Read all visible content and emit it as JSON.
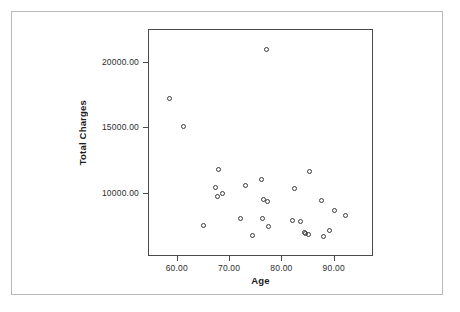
{
  "chart_data": {
    "type": "scatter",
    "title": "",
    "xlabel": "Age",
    "ylabel": "Total Charges",
    "xlim": [
      54.5,
      97.5
    ],
    "ylim": [
      5200,
      22500
    ],
    "grid": false,
    "legend": null,
    "marker": "open-circle",
    "xticks": [
      60,
      70,
      80,
      90
    ],
    "xtick_labels": [
      "60.00",
      "70.00",
      "80.00",
      "90.00"
    ],
    "yticks": [
      10000,
      15000,
      20000
    ],
    "ytick_labels": [
      "10000.00",
      "15000.00",
      "20000.00"
    ],
    "series": [
      {
        "name": "Total Charges vs Age",
        "points": [
          {
            "x": 58.5,
            "y": 17250
          },
          {
            "x": 61.0,
            "y": 15150
          },
          {
            "x": 65.0,
            "y": 7600
          },
          {
            "x": 67.8,
            "y": 11900
          },
          {
            "x": 67.2,
            "y": 10500
          },
          {
            "x": 67.5,
            "y": 9800
          },
          {
            "x": 68.5,
            "y": 10050
          },
          {
            "x": 72.0,
            "y": 8150
          },
          {
            "x": 73.0,
            "y": 10650
          },
          {
            "x": 74.3,
            "y": 6850
          },
          {
            "x": 76.0,
            "y": 11100
          },
          {
            "x": 76.1,
            "y": 8150
          },
          {
            "x": 76.3,
            "y": 9550
          },
          {
            "x": 77.1,
            "y": 9400
          },
          {
            "x": 77.3,
            "y": 7500
          },
          {
            "x": 77.0,
            "y": 21000
          },
          {
            "x": 82.0,
            "y": 7950
          },
          {
            "x": 82.3,
            "y": 10450
          },
          {
            "x": 83.4,
            "y": 7900
          },
          {
            "x": 84.2,
            "y": 7050
          },
          {
            "x": 84.5,
            "y": 7000
          },
          {
            "x": 85.0,
            "y": 6950
          },
          {
            "x": 85.1,
            "y": 11700
          },
          {
            "x": 87.5,
            "y": 9500
          },
          {
            "x": 87.8,
            "y": 6800
          },
          {
            "x": 89.0,
            "y": 7250
          },
          {
            "x": 90.0,
            "y": 8750
          },
          {
            "x": 92.0,
            "y": 8350
          }
        ]
      }
    ]
  },
  "style": {
    "marker_color": "#3a3a3a",
    "frame_color": "#4a4a4a",
    "outer_frame_color": "#b9b9b9",
    "background": "#ffffff",
    "text_color": "#2d2d2d"
  }
}
